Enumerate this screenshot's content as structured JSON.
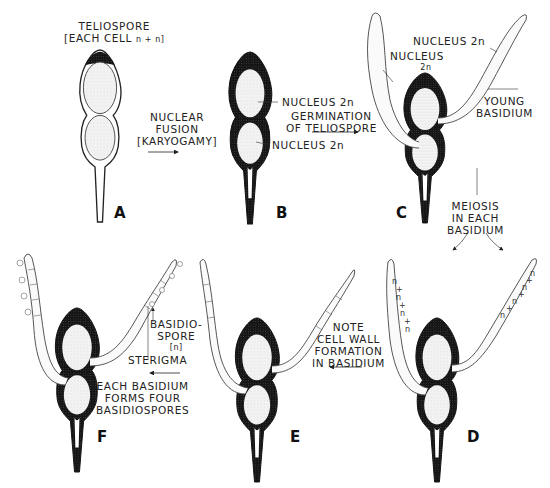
{
  "panels": [
    {
      "id": "A",
      "label": "A",
      "caption": "Teliospore, each cell n + n"
    },
    {
      "id": "B",
      "label": "B",
      "caption": "Nuclear fusion (karyogamy) – nucleus 2n in each cell"
    },
    {
      "id": "C",
      "label": "C",
      "caption": "Germination of teliospore – young basidium"
    },
    {
      "id": "D",
      "label": "D",
      "caption": "Meiosis in each basidium"
    },
    {
      "id": "E",
      "label": "E",
      "caption": "Cell wall formation in basidium"
    },
    {
      "id": "F",
      "label": "F",
      "caption": "Each basidium forms four basidiospores"
    }
  ],
  "labels": {
    "teliospore_line1": "TELIOSPORE",
    "teliospore_line2": "[EACH CELL",
    "teliospore_ploidy": "n + n]",
    "fusion_line1": "NUCLEAR",
    "fusion_line2": "FUSION",
    "fusion_line3": "[KARYOGAMY]",
    "b_nucleus_top": "NUCLEUS 2n",
    "b_nucleus_bottom": "NUCLEUS 2n",
    "germination_line1": "GERMINATION",
    "germination_line2": "OF TELIOSPORE",
    "c_nucleus_right": "NUCLEUS 2n",
    "c_nucleus_left_line1": "NUCLEUS",
    "c_nucleus_left_line2": "2n",
    "young_line1": "YOUNG",
    "young_line2": "BASIDIUM",
    "meiosis_line1": "MEIOSIS",
    "meiosis_line2": "IN EACH",
    "meiosis_line3": "BASIDIUM",
    "note_line1": "NOTE",
    "note_line2": "CELL WALL",
    "note_line3": "FORMATION",
    "note_line4": "IN BASIDIUM",
    "basidiospore_line1": "BASIDIO-",
    "basidiospore_line2": "SPORE",
    "basidiospore_line3": "[n]",
    "sterigma": "STERIGMA",
    "each_line1": "EACH BASIDIUM",
    "each_line2": "FORMS FOUR",
    "each_line3": "BASIDIOSPORES",
    "d_left_nuclei": [
      "n",
      "+",
      "n",
      "+",
      "n",
      "+",
      "n"
    ],
    "d_right_nuclei": [
      "n",
      "+",
      "n",
      "+",
      "n",
      "+",
      "n"
    ]
  },
  "colors": {
    "ink": "#111111",
    "stipple": "#cfcfcf",
    "paper": "#ffffff"
  }
}
